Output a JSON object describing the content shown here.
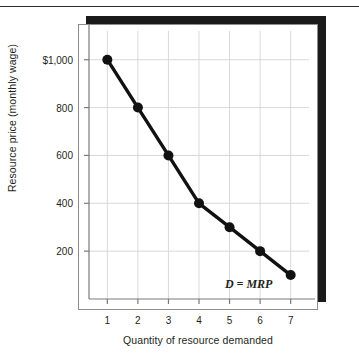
{
  "figure": {
    "background_color": "#ffffff",
    "plot_background_color": "#ffffff",
    "shadow_color": "#1a1a1a",
    "frame_border_color": "#8c8c8c",
    "grid_color": "#d9d9d9",
    "series_color": "#111111"
  },
  "chart_data": {
    "type": "line",
    "title": "",
    "xlabel": "Quantity of resource demanded",
    "ylabel": "Resource price (monthly wage)",
    "x": [
      1,
      2,
      3,
      4,
      5,
      6,
      7
    ],
    "values": [
      1000,
      800,
      600,
      400,
      300,
      200,
      100
    ],
    "series": [
      {
        "name": "D = MRP",
        "x": [
          1,
          2,
          3,
          4,
          5,
          6,
          7
        ],
        "values": [
          1000,
          800,
          600,
          400,
          300,
          200,
          100
        ]
      }
    ],
    "xtick_labels": [
      "1",
      "2",
      "3",
      "4",
      "5",
      "6",
      "7"
    ],
    "xtick_values": [
      1,
      2,
      3,
      4,
      5,
      6,
      7
    ],
    "ytick_labels": [
      "$1,000",
      "800",
      "600",
      "400",
      "200"
    ],
    "ytick_values": [
      1000,
      800,
      600,
      400,
      200
    ],
    "xlim": [
      0.4,
      7.6
    ],
    "ylim": [
      0,
      1120
    ],
    "grid": true,
    "legend_position": "inside-bottom-right",
    "annotations": [
      {
        "text": "D = MRP",
        "x": 6.55,
        "y": 60
      }
    ],
    "markers": "filled-circle",
    "marker_size": 5
  }
}
